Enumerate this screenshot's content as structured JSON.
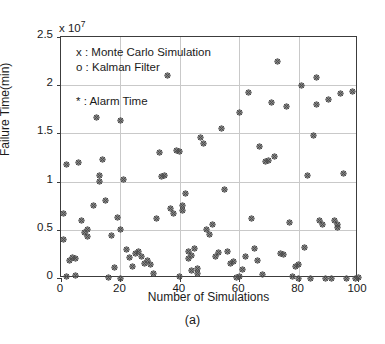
{
  "chart_data": {
    "type": "scatter",
    "title": "",
    "caption": "(a)",
    "xlabel": "Number of Simulations",
    "ylabel": "Failure Time(min)",
    "y_multiplier_text": "x 10",
    "y_exponent": "7",
    "xlim": [
      0,
      100
    ],
    "ylim": [
      0,
      2.5
    ],
    "xticks": [
      0,
      20,
      40,
      60,
      80,
      100
    ],
    "xtick_labels": [
      "0",
      "20",
      "40",
      "60",
      "80",
      "100"
    ],
    "yticks": [
      0,
      0.5,
      1,
      1.5,
      2,
      2.5
    ],
    "ytick_labels": [
      "0",
      "0.5",
      "1",
      "1.5",
      "2",
      "2.5"
    ],
    "grid": true,
    "grid_color": "#c9c9c9",
    "axis_color": "#3c3c3c",
    "marker_color": "#4d4d4d",
    "legend_position": "upper-left-inside",
    "legend": [
      {
        "symbol": "x",
        "label": "x : Monte Carlo Simulation"
      },
      {
        "symbol": "o",
        "label": "o : Kalman Filter"
      },
      {
        "symbol": "*",
        "label": "* : Alarm Time"
      }
    ],
    "series": [
      {
        "name": "Overlaid Monte Carlo / Kalman Filter / Alarm Time",
        "marker": "x-o-star-composite",
        "points": [
          [
            1,
            0.4
          ],
          [
            1,
            0.67
          ],
          [
            2,
            0.02
          ],
          [
            2,
            1.18
          ],
          [
            3,
            0.18
          ],
          [
            4,
            0.21
          ],
          [
            5,
            0.03
          ],
          [
            5,
            0.2
          ],
          [
            6,
            1.2
          ],
          [
            7,
            0.6
          ],
          [
            8,
            0.47
          ],
          [
            9,
            0.5
          ],
          [
            9,
            0.43
          ],
          [
            11,
            0.75
          ],
          [
            12,
            1.67
          ],
          [
            13,
            1.0
          ],
          [
            13,
            1.06
          ],
          [
            14,
            1.23
          ],
          [
            15,
            0.8
          ],
          [
            16,
            0.01
          ],
          [
            17,
            0.44
          ],
          [
            18,
            0.11
          ],
          [
            19,
            0.63
          ],
          [
            20,
            0.0
          ],
          [
            20,
            1.63
          ],
          [
            20,
            0.5
          ],
          [
            21,
            1.02
          ],
          [
            22,
            0.3
          ],
          [
            23,
            0.21
          ],
          [
            24,
            0.12
          ],
          [
            25,
            0.25
          ],
          [
            26,
            0.28
          ],
          [
            27,
            0.22
          ],
          [
            28,
            0.15
          ],
          [
            29,
            0.18
          ],
          [
            30,
            0.14
          ],
          [
            31,
            0.05
          ],
          [
            32,
            0.62
          ],
          [
            33,
            1.3
          ],
          [
            34,
            1.05
          ],
          [
            35,
            1.06
          ],
          [
            36,
            2.1
          ],
          [
            37,
            0.72
          ],
          [
            38,
            0.67
          ],
          [
            39,
            1.32
          ],
          [
            40,
            1.31
          ],
          [
            40,
            0.02
          ],
          [
            41,
            0.7
          ],
          [
            41,
            0.75
          ],
          [
            42,
            0.88
          ],
          [
            43,
            0.2
          ],
          [
            43,
            0.28
          ],
          [
            44,
            0.23
          ],
          [
            44,
            0.08
          ],
          [
            45,
            0.31
          ],
          [
            46,
            0.05
          ],
          [
            46,
            0.1
          ],
          [
            47,
            1.46
          ],
          [
            48,
            1.4
          ],
          [
            49,
            0.5
          ],
          [
            50,
            0.45
          ],
          [
            51,
            0.55
          ],
          [
            52,
            0.22
          ],
          [
            53,
            0.26
          ],
          [
            54,
            1.55
          ],
          [
            55,
            0.92
          ],
          [
            56,
            0.28
          ],
          [
            57,
            0.15
          ],
          [
            58,
            0.17
          ],
          [
            59,
            0.01
          ],
          [
            60,
            0.02
          ],
          [
            60,
            1.72
          ],
          [
            61,
            0.09
          ],
          [
            62,
            0.22
          ],
          [
            63,
            1.92
          ],
          [
            64,
            0.62
          ],
          [
            65,
            0.31
          ],
          [
            66,
            0.18
          ],
          [
            67,
            1.36
          ],
          [
            68,
            0.04
          ],
          [
            69,
            1.21
          ],
          [
            70,
            1.22
          ],
          [
            71,
            1.82
          ],
          [
            72,
            1.26
          ],
          [
            73,
            2.25
          ],
          [
            74,
            0.25
          ],
          [
            75,
            0.24
          ],
          [
            76,
            1.78
          ],
          [
            77,
            0.58
          ],
          [
            78,
            0.02
          ],
          [
            79,
            0.12
          ],
          [
            80,
            0.14
          ],
          [
            80,
            0.0
          ],
          [
            81,
            2.0
          ],
          [
            82,
            0.32
          ],
          [
            83,
            1.06
          ],
          [
            84,
            0.0
          ],
          [
            85,
            1.48
          ],
          [
            86,
            2.08
          ],
          [
            86,
            1.8
          ],
          [
            87,
            0.6
          ],
          [
            88,
            0.55
          ],
          [
            89,
            0.0
          ],
          [
            90,
            1.85
          ],
          [
            91,
            0.0
          ],
          [
            92,
            0.6
          ],
          [
            93,
            0.52
          ],
          [
            93,
            0.55
          ],
          [
            94,
            1.91
          ],
          [
            95,
            1.08
          ],
          [
            96,
            0.0
          ],
          [
            98,
            1.93
          ],
          [
            99,
            0.0
          ],
          [
            100,
            0.01
          ]
        ]
      }
    ]
  }
}
